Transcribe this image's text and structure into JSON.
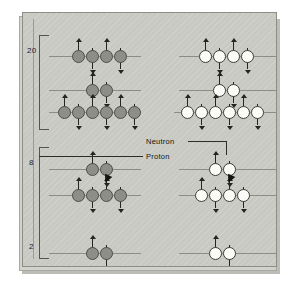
{
  "figure": {
    "panel_color": "#c9c9c3",
    "proton_color": "#8e8e88",
    "neutron_color": "#fbfbf8"
  },
  "axis": {
    "labels": [
      {
        "text": "20",
        "x": 16,
        "y": 40
      },
      {
        "text": "8",
        "x": 18,
        "y": 152
      },
      {
        "text": "2",
        "x": 18,
        "y": 236
      }
    ],
    "brackets": [
      {
        "x": 28,
        "y": 22,
        "height": 95
      },
      {
        "x": 28,
        "y": 134,
        "height": 112
      }
    ]
  },
  "callouts": [
    {
      "name": "neutron-label",
      "text": "Neutron",
      "x": 135,
      "y": 131
    },
    {
      "name": "proton-label",
      "text": "Proton",
      "x": 135,
      "y": 146
    }
  ],
  "levels": [
    {
      "name": "level-20-proton",
      "particle": "proton",
      "line": {
        "x": 38,
        "y": 43,
        "width": 92
      },
      "nucleons": [
        {
          "x": 61,
          "spin": "up"
        },
        {
          "x": 75,
          "spin": "down"
        },
        {
          "x": 89,
          "spin": "up"
        },
        {
          "x": 103,
          "spin": "down"
        }
      ]
    },
    {
      "name": "level-20-neutron",
      "particle": "neutron",
      "line": {
        "x": 168,
        "y": 43,
        "width": 100
      },
      "nucleons": [
        {
          "x": 188,
          "spin": "up"
        },
        {
          "x": 202,
          "spin": "down"
        },
        {
          "x": 216,
          "spin": "up"
        },
        {
          "x": 230,
          "spin": "down"
        }
      ]
    },
    {
      "name": "level-mid-proton-2",
      "particle": "proton",
      "line": {
        "x": 38,
        "y": 77,
        "width": 92
      },
      "nucleons": [
        {
          "x": 75,
          "spin": "up"
        },
        {
          "x": 89,
          "spin": "down"
        }
      ]
    },
    {
      "name": "level-mid-neutron-2",
      "particle": "neutron",
      "line": {
        "x": 168,
        "y": 77,
        "width": 100
      },
      "nucleons": [
        {
          "x": 202,
          "spin": "up"
        },
        {
          "x": 216,
          "spin": "down"
        }
      ]
    },
    {
      "name": "level-mid-proton-6",
      "particle": "proton",
      "line": {
        "x": 38,
        "y": 99,
        "width": 92
      },
      "nucleons": [
        {
          "x": 47,
          "spin": "up"
        },
        {
          "x": 61,
          "spin": "down"
        },
        {
          "x": 75,
          "spin": "up"
        },
        {
          "x": 89,
          "spin": "down"
        },
        {
          "x": 103,
          "spin": "up"
        },
        {
          "x": 117,
          "spin": "down"
        }
      ]
    },
    {
      "name": "level-mid-neutron-6",
      "particle": "neutron",
      "line": {
        "x": 163,
        "y": 99,
        "width": 105
      },
      "nucleons": [
        {
          "x": 170,
          "spin": "up"
        },
        {
          "x": 184,
          "spin": "down"
        },
        {
          "x": 198,
          "spin": "up"
        },
        {
          "x": 212,
          "spin": "down"
        },
        {
          "x": 226,
          "spin": "up"
        },
        {
          "x": 240,
          "spin": "down"
        }
      ]
    },
    {
      "name": "level-8-proton",
      "particle": "proton",
      "line": {
        "x": 38,
        "y": 156,
        "width": 92
      },
      "nucleons": [
        {
          "x": 75,
          "spin": "up"
        },
        {
          "x": 89,
          "spin": "down"
        }
      ]
    },
    {
      "name": "level-8-neutron",
      "particle": "neutron",
      "line": {
        "x": 168,
        "y": 156,
        "width": 100
      },
      "nucleons": [
        {
          "x": 198,
          "spin": "up"
        },
        {
          "x": 212,
          "spin": "down"
        }
      ]
    },
    {
      "name": "level-low-proton-4",
      "particle": "proton",
      "line": {
        "x": 38,
        "y": 182,
        "width": 92
      },
      "nucleons": [
        {
          "x": 61,
          "spin": "up"
        },
        {
          "x": 75,
          "spin": "down"
        },
        {
          "x": 89,
          "spin": "up"
        },
        {
          "x": 103,
          "spin": "down"
        }
      ]
    },
    {
      "name": "level-low-neutron-4",
      "particle": "neutron",
      "line": {
        "x": 168,
        "y": 182,
        "width": 100
      },
      "nucleons": [
        {
          "x": 184,
          "spin": "up"
        },
        {
          "x": 198,
          "spin": "down"
        },
        {
          "x": 212,
          "spin": "up"
        },
        {
          "x": 226,
          "spin": "down"
        }
      ]
    },
    {
      "name": "level-2-proton",
      "particle": "proton",
      "line": {
        "x": 38,
        "y": 240,
        "width": 92
      },
      "nucleons": [
        {
          "x": 75,
          "spin": "up"
        },
        {
          "x": 89,
          "spin": "down"
        }
      ]
    },
    {
      "name": "level-2-neutron",
      "particle": "neutron",
      "line": {
        "x": 168,
        "y": 240,
        "width": 100
      },
      "nucleons": [
        {
          "x": 198,
          "spin": "up"
        },
        {
          "x": 212,
          "spin": "down"
        }
      ]
    }
  ],
  "pointers": [
    {
      "name": "proton-pointer",
      "x": 92,
      "y": 166
    },
    {
      "name": "neutron-pointer",
      "x": 215,
      "y": 166
    }
  ]
}
